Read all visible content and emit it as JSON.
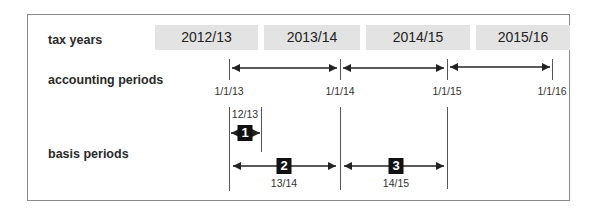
{
  "rows": {
    "tax_years": "tax years",
    "accounting_periods": "accounting periods",
    "basis_periods": "basis periods"
  },
  "tax_years": [
    "2012/13",
    "2013/14",
    "2014/15",
    "2015/16"
  ],
  "accounting_dates": [
    "1/1/13",
    "1/1/14",
    "1/1/15",
    "1/1/16"
  ],
  "basis_periods": [
    {
      "number": "1",
      "label": "12/13"
    },
    {
      "number": "2",
      "label": "13/14"
    },
    {
      "number": "3",
      "label": "14/15"
    }
  ],
  "colors": {
    "tax_year_fill": "#e3e3e3",
    "badge": "#111111",
    "line": "#222222"
  }
}
